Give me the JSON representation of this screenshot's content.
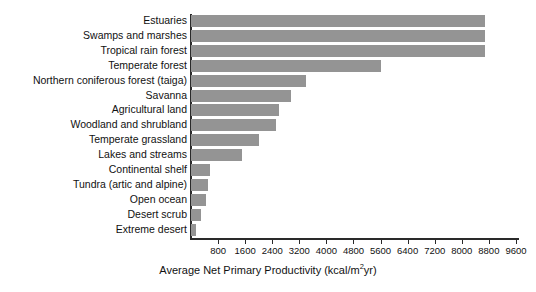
{
  "chart_data": {
    "type": "bar",
    "orientation": "horizontal",
    "title": "",
    "xlabel": "Average Net Primary Productivity (kcal/m²yr)",
    "ylabel": "",
    "xlim": [
      0,
      9900
    ],
    "grid": false,
    "legend": null,
    "bar_color": "#949494",
    "axis_color": "#2a2a2a",
    "xticks": [
      800,
      1600,
      2400,
      3200,
      4000,
      4800,
      5600,
      6400,
      7200,
      8000,
      8800,
      9600
    ],
    "xtick_labels": [
      "800",
      "1600",
      "2400",
      "3200",
      "4000",
      "4800",
      "5600",
      "6400",
      "7200",
      "8000",
      "8800",
      "9600"
    ],
    "categories": [
      "Estuaries",
      "Swamps and marshes",
      "Tropical rain forest",
      "Temperate forest",
      "Northern coniferous forest (taiga)",
      "Savanna",
      "Agricultural land",
      "Woodland and shrubland",
      "Temperate grassland",
      "Lakes and streams",
      "Continental shelf",
      "Tundra (artic and alpine)",
      "Open ocean",
      "Desert scrub",
      "Extreme desert"
    ],
    "values": [
      8700,
      8700,
      8700,
      5600,
      3400,
      2950,
      2600,
      2500,
      2000,
      1500,
      550,
      500,
      450,
      300,
      150
    ]
  },
  "axis_title_parts": {
    "before": "Average Net Primary Productivity (kcal/m",
    "superscript": "2",
    "after": "yr)"
  }
}
